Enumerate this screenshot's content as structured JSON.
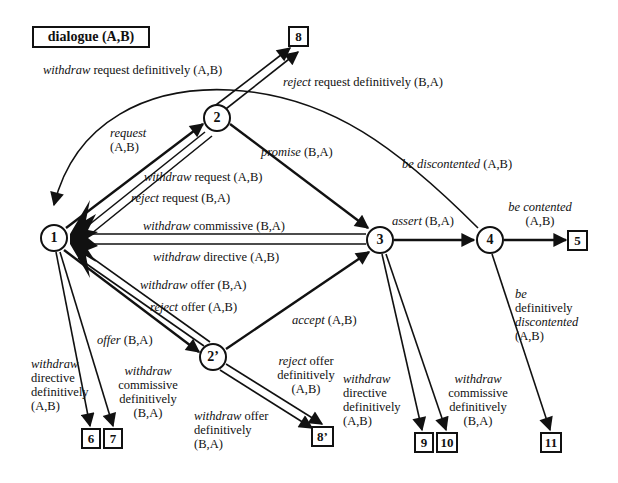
{
  "title": "dialogue (A,B)",
  "nodes": {
    "n1": "1",
    "n2": "2",
    "n3": "3",
    "n4": "4",
    "n2p": "2’"
  },
  "terminals": {
    "t5": "5",
    "t6": "6",
    "t7": "7",
    "t8": "8",
    "t8p": "8’",
    "t9": "9",
    "t10": "10",
    "t11": "11"
  },
  "edges": {
    "request": {
      "verb": "request",
      "rest": "",
      "roles": "(A,B)"
    },
    "withdraw_request_definitively": {
      "verb": "withdraw",
      "rest": " request definitively (A,B)"
    },
    "reject_request_definitively": {
      "verb": "reject",
      "rest": " request definitively (B,A)"
    },
    "withdraw_request": {
      "verb": "withdraw",
      "rest": " request (A,B)"
    },
    "reject_request": {
      "verb": "reject",
      "rest": " request (B,A)"
    },
    "promise": {
      "verb": "promise",
      "rest": " (B,A)"
    },
    "be_discontented": {
      "verb": "be discontented",
      "rest": " (A,B)"
    },
    "withdraw_commissive": {
      "verb": "withdraw",
      "rest": " commissive (B,A)"
    },
    "withdraw_directive": {
      "verb": "withdraw",
      "rest": " directive (A,B)"
    },
    "assert": {
      "verb": "assert",
      "rest": " (B,A)"
    },
    "be_contented": {
      "verb": "be contented",
      "roles": "(A,B)"
    },
    "withdraw_offer": {
      "verb": "withdraw",
      "rest": " offer (B,A)"
    },
    "reject_offer": {
      "verb": "reject",
      "rest": " offer (A,B)"
    },
    "offer": {
      "verb": "offer",
      "rest": " (B,A)"
    },
    "accept": {
      "verb": "accept",
      "rest": " (A,B)"
    },
    "withdraw_directive_definitively_1": {
      "verb": "withdraw",
      "l2": "directive",
      "l3": "definitively",
      "l4": "(A,B)"
    },
    "withdraw_commissive_definitively_1": {
      "verb": "withdraw",
      "l2": "commissive",
      "l3": "definitively",
      "l4": "(B,A)"
    },
    "reject_offer_definitively": {
      "verb": "reject",
      "l1rest": " offer",
      "l2": "definitively",
      "l3": "(A,B)"
    },
    "withdraw_offer_definitively": {
      "verb": "withdraw",
      "l1rest": " offer",
      "l2": "definitively",
      "l3": "(B,A)"
    },
    "withdraw_directive_definitively_3": {
      "verb": "withdraw",
      "l2": "directive",
      "l3": "definitively",
      "l4": "(A,B)"
    },
    "withdraw_commissive_definitively_3": {
      "verb": "withdraw",
      "l2": "commissive",
      "l3": "definitively",
      "l4": "(B,A)"
    },
    "be_definitively_discontented": {
      "l1": "be",
      "l2": "definitively",
      "l3": "discontented",
      "l4": "(A,B)"
    }
  }
}
